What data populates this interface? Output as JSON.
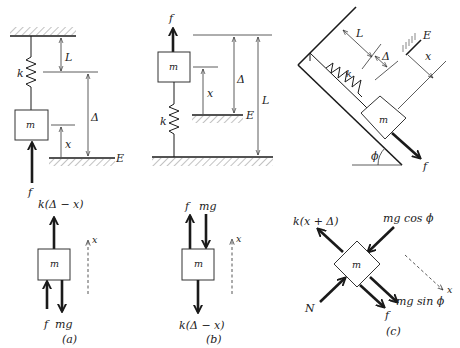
{
  "figure": {
    "panels": [
      {
        "id": "a",
        "caption": "(a)",
        "mass_label": "m",
        "spring_label": "k",
        "length_label": "L",
        "delta_label": "Δ",
        "x_label": "x",
        "equilibrium_label": "E",
        "force_label": "f",
        "fbd": {
          "mass_label": "m",
          "spring_force": "k(Δ − x)",
          "applied_force": "f",
          "weight": "mg",
          "axis_label": "x"
        }
      },
      {
        "id": "b",
        "caption": "(b)",
        "mass_label": "m",
        "spring_label": "k",
        "length_label": "L",
        "delta_label": "Δ",
        "x_label": "x",
        "equilibrium_label": "E",
        "force_label": "f",
        "fbd": {
          "mass_label": "m",
          "spring_force": "k(Δ − x)",
          "applied_force": "f",
          "weight": "mg",
          "axis_label": "x"
        }
      },
      {
        "id": "c",
        "caption": "(c)",
        "mass_label": "m",
        "spring_label": "k",
        "length_label": "L",
        "delta_label": "Δ",
        "x_label": "x",
        "equilibrium_label": "E",
        "force_label": "f",
        "angle_label": "ϕ",
        "fbd": {
          "mass_label": "m",
          "spring_force": "k(x + Δ)",
          "normal_force": "N",
          "weight_normal": "mg cos ϕ",
          "weight_tangent": "mg sin ϕ",
          "applied_force": "f",
          "axis_label": "x"
        }
      }
    ]
  }
}
